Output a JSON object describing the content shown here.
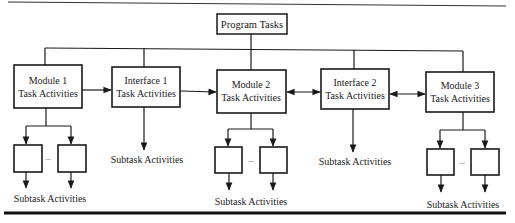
{
  "diagram": {
    "root": {
      "label": "Program Tasks"
    },
    "nodes": [
      {
        "id": "module1",
        "line1": "Module 1",
        "line2": "Task Activities",
        "type": "module"
      },
      {
        "id": "interface1",
        "line1": "Interface 1",
        "line2": "Task Activities",
        "type": "interface"
      },
      {
        "id": "module2",
        "line1": "Module 2",
        "line2": "Task Activities",
        "type": "module"
      },
      {
        "id": "interface2",
        "line1": "Interface 2",
        "line2": "Task Activities",
        "type": "interface"
      },
      {
        "id": "module3",
        "line1": "Module 3",
        "line2": "Task Activities",
        "type": "module"
      }
    ],
    "edges": [
      {
        "from": "module1",
        "to": "interface1",
        "direction": "forward"
      },
      {
        "from": "interface1",
        "to": "module2",
        "direction": "forward"
      },
      {
        "from": "module2",
        "to": "interface2",
        "direction": "bidirectional"
      },
      {
        "from": "interface2",
        "to": "module3",
        "direction": "bidirectional"
      }
    ],
    "subtasks": {
      "module1": "Subtask Activities",
      "interface1": "Subtask Activities",
      "module2": "Subtask Activities",
      "interface2": "Subtask Activities",
      "module3": "Subtask Activities"
    },
    "ellipsis": "..."
  }
}
